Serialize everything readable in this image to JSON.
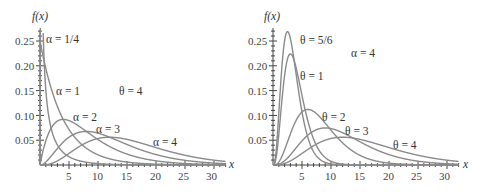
{
  "chart_data": [
    {
      "type": "line",
      "title": "Gamma densities, θ = 4",
      "xlabel": "x",
      "ylabel": "f(x)",
      "xlim": [
        0,
        32
      ],
      "ylim": [
        0,
        0.27
      ],
      "xticks": [
        "5",
        "10",
        "15",
        "20",
        "25",
        "30"
      ],
      "yticks": [
        "0.05",
        "0.10",
        "0.15",
        "0.20",
        "0.25"
      ],
      "grid": false,
      "annotation": "θ = 4",
      "fixed": {
        "theta": 4
      },
      "series": [
        {
          "name": "α = 1/4",
          "alpha": 0.25,
          "theta": 4
        },
        {
          "name": "α = 1",
          "alpha": 1,
          "theta": 4
        },
        {
          "name": "α = 2",
          "alpha": 2,
          "theta": 4
        },
        {
          "name": "α = 3",
          "alpha": 3,
          "theta": 4
        },
        {
          "name": "α = 4",
          "alpha": 4,
          "theta": 4
        }
      ]
    },
    {
      "type": "line",
      "title": "Gamma densities, α = 4",
      "xlabel": "x",
      "ylabel": "f(x)",
      "xlim": [
        0,
        32
      ],
      "ylim": [
        0,
        0.27
      ],
      "xticks": [
        "5",
        "10",
        "15",
        "20",
        "25",
        "30"
      ],
      "yticks": [
        "0.05",
        "0.10",
        "0.15",
        "0.20",
        "0.25"
      ],
      "grid": false,
      "annotation": "α = 4",
      "fixed": {
        "alpha": 4
      },
      "series": [
        {
          "name": "θ = 5/6",
          "alpha": 4,
          "theta": 0.8333
        },
        {
          "name": "θ = 1",
          "alpha": 4,
          "theta": 1
        },
        {
          "name": "θ = 2",
          "alpha": 4,
          "theta": 2
        },
        {
          "name": "θ = 3",
          "alpha": 4,
          "theta": 3
        },
        {
          "name": "θ = 4",
          "alpha": 4,
          "theta": 4
        }
      ]
    }
  ],
  "left": {
    "ylabel": "f(x)",
    "xlabel": "x",
    "note": "θ = 4",
    "labels": [
      "α = 1/4",
      "α = 1",
      "α = 2",
      "α = 3",
      "α = 4"
    ],
    "yticks": [
      "0.25",
      "0.20",
      "0.15",
      "0.10",
      "0.05"
    ],
    "xticks": [
      "5",
      "10",
      "15",
      "20",
      "25",
      "30"
    ]
  },
  "right": {
    "ylabel": "f(x)",
    "xlabel": "x",
    "note": "α = 4",
    "labels": [
      "θ = 5/6",
      "θ = 1",
      "θ = 2",
      "θ = 3",
      "θ = 4"
    ],
    "yticks": [
      "0.25",
      "0.20",
      "0.15",
      "0.10",
      "0.05"
    ],
    "xticks": [
      "5",
      "10",
      "15",
      "20",
      "25",
      "30"
    ]
  }
}
